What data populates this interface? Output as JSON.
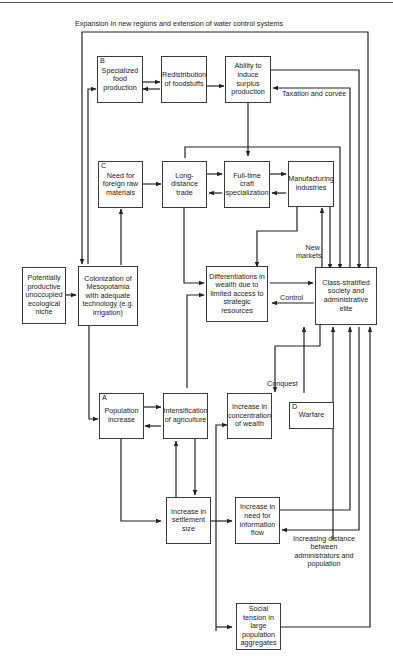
{
  "diagram": {
    "top_label": "Expansion in new regions and extension of water control systems",
    "nodes": {
      "specialized_food": {
        "tag": "B",
        "text": "Specialized food production"
      },
      "redistribution": {
        "text": "Redistribution of foodstuffs"
      },
      "surplus": {
        "text": "Ability to induce surplus production"
      },
      "foreign_raw": {
        "tag": "C",
        "text": "Need for foreign raw materials"
      },
      "long_distance": {
        "text": "Long-distance trade"
      },
      "craft": {
        "text": "Full-time craft specialization"
      },
      "manufacturing": {
        "text": "Manufacturing industries"
      },
      "niche": {
        "text": "Potentially productive unoccupied ecological niche"
      },
      "colonization": {
        "text": "Colonization of Mesopotamia with adequate technology (e.g. irrigation)"
      },
      "differentiations": {
        "text": "Differentiations in wealth due to limited access to strategic resources"
      },
      "class_stratified": {
        "text": "Class-stratified society and administrative elite"
      },
      "population": {
        "tag": "A",
        "text": "Population increase"
      },
      "intensification": {
        "text": "Intensification of agriculture"
      },
      "concentration": {
        "text": "Increase in concentration of wealth"
      },
      "warfare": {
        "tag": "D",
        "text": "Warfare"
      },
      "settlement": {
        "text": "Increase in settlement size"
      },
      "information": {
        "text": "Increase in need for information flow"
      },
      "social_tension": {
        "text": "Social tension in large population aggregates"
      }
    },
    "edge_labels": {
      "taxation": "Taxation and corvée",
      "new_markets": "New markets",
      "control": "Control",
      "conquest": "Conquest",
      "distance": "Increasing distance between administrators and population"
    }
  }
}
